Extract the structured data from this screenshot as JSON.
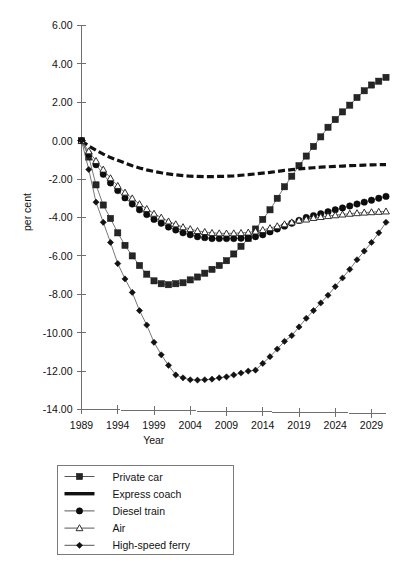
{
  "figure": {
    "width": 404,
    "height": 564,
    "background": "#ffffff"
  },
  "chart_data": {
    "type": "line",
    "title": "",
    "xlabel": "Year",
    "ylabel": "per cent",
    "grid": false,
    "legend_position": "below-left",
    "xlim": [
      1989,
      2031
    ],
    "ylim": [
      -14,
      6
    ],
    "ytick_step": 2,
    "x_tick_labels": [
      "1989",
      "1994",
      "1999",
      "2004",
      "2009",
      "2014",
      "2019",
      "2024",
      "2029"
    ],
    "x_tick_values": [
      1989,
      1994,
      1999,
      2004,
      2009,
      2014,
      2019,
      2024,
      2029
    ],
    "y_tick_labels": [
      "6.00",
      "4.00",
      "2.00",
      "0.00",
      "-2.00",
      "-4.00",
      "-6.00",
      "-8.00",
      "-10.00",
      "-12.00",
      "-14.00"
    ],
    "y_tick_values": [
      6,
      4,
      2,
      0,
      -2,
      -4,
      -6,
      -8,
      -10,
      -12,
      -14
    ],
    "x": [
      1989,
      1990,
      1991,
      1992,
      1993,
      1994,
      1995,
      1996,
      1997,
      1998,
      1999,
      2000,
      2001,
      2002,
      2003,
      2004,
      2005,
      2006,
      2007,
      2008,
      2009,
      2010,
      2011,
      2012,
      2013,
      2014,
      2015,
      2016,
      2017,
      2018,
      2019,
      2020,
      2021,
      2022,
      2023,
      2024,
      2025,
      2026,
      2027,
      2028,
      2029,
      2030,
      2031
    ],
    "series": [
      {
        "name": "Private car",
        "marker": "square",
        "color": "#262626",
        "values": [
          0.0,
          -0.85,
          -2.3,
          -3.35,
          -4.05,
          -4.8,
          -5.45,
          -6.0,
          -6.5,
          -6.95,
          -7.3,
          -7.45,
          -7.5,
          -7.45,
          -7.4,
          -7.25,
          -7.1,
          -6.9,
          -6.7,
          -6.5,
          -6.25,
          -5.9,
          -5.5,
          -5.1,
          -4.6,
          -4.1,
          -3.6,
          -3.0,
          -2.4,
          -1.85,
          -1.3,
          -0.8,
          -0.3,
          0.2,
          0.7,
          1.1,
          1.5,
          1.85,
          2.25,
          2.6,
          2.9,
          3.1,
          3.3
        ]
      },
      {
        "name": "Express coach",
        "marker": "thick-dash",
        "color": "#111111",
        "values": [
          0.0,
          -0.28,
          -0.5,
          -0.7,
          -0.88,
          -1.02,
          -1.16,
          -1.3,
          -1.42,
          -1.52,
          -1.6,
          -1.67,
          -1.73,
          -1.78,
          -1.82,
          -1.85,
          -1.86,
          -1.87,
          -1.87,
          -1.86,
          -1.85,
          -1.83,
          -1.8,
          -1.77,
          -1.73,
          -1.69,
          -1.65,
          -1.6,
          -1.55,
          -1.51,
          -1.47,
          -1.44,
          -1.41,
          -1.38,
          -1.36,
          -1.34,
          -1.32,
          -1.3,
          -1.29,
          -1.27,
          -1.26,
          -1.25,
          -1.25
        ]
      },
      {
        "name": "Diesel train",
        "marker": "circle",
        "color": "#0d0d0d",
        "values": [
          0.0,
          -0.7,
          -1.25,
          -1.75,
          -2.2,
          -2.6,
          -2.98,
          -3.3,
          -3.6,
          -3.85,
          -4.1,
          -4.3,
          -4.5,
          -4.65,
          -4.8,
          -4.9,
          -5.0,
          -5.05,
          -5.1,
          -5.1,
          -5.1,
          -5.1,
          -5.08,
          -5.05,
          -5.0,
          -4.9,
          -4.75,
          -4.6,
          -4.45,
          -4.3,
          -4.15,
          -4.0,
          -3.9,
          -3.8,
          -3.7,
          -3.6,
          -3.5,
          -3.4,
          -3.3,
          -3.2,
          -3.1,
          -3.0,
          -2.9
        ]
      },
      {
        "name": "Air",
        "marker": "triangle",
        "color": "#1a1a1a",
        "values": [
          0.0,
          -0.55,
          -1.05,
          -1.5,
          -1.95,
          -2.35,
          -2.7,
          -3.0,
          -3.3,
          -3.55,
          -3.8,
          -4.0,
          -4.2,
          -4.35,
          -4.5,
          -4.6,
          -4.7,
          -4.75,
          -4.8,
          -4.82,
          -4.83,
          -4.82,
          -4.8,
          -4.78,
          -4.72,
          -4.65,
          -4.55,
          -4.45,
          -4.35,
          -4.25,
          -4.15,
          -4.1,
          -4.02,
          -3.97,
          -3.92,
          -3.88,
          -3.84,
          -3.8,
          -3.77,
          -3.74,
          -3.72,
          -3.7,
          -3.68
        ]
      },
      {
        "name": "High-speed ferry",
        "marker": "diamond",
        "color": "#121212",
        "values": [
          0.0,
          -1.5,
          -3.2,
          -4.25,
          -5.3,
          -6.4,
          -7.2,
          -7.9,
          -8.85,
          -9.6,
          -10.5,
          -11.15,
          -11.7,
          -12.2,
          -12.35,
          -12.45,
          -12.47,
          -12.45,
          -12.42,
          -12.35,
          -12.3,
          -12.2,
          -12.1,
          -12.0,
          -11.95,
          -11.6,
          -11.25,
          -10.85,
          -10.45,
          -10.15,
          -9.7,
          -9.25,
          -8.85,
          -8.45,
          -8.05,
          -7.6,
          -7.15,
          -6.7,
          -6.2,
          -5.75,
          -5.3,
          -4.8,
          -4.25
        ]
      }
    ]
  },
  "legend": {
    "items": [
      {
        "label": "Private car",
        "marker": "square"
      },
      {
        "label": "Express coach",
        "marker": "thick-dash"
      },
      {
        "label": "Diesel train",
        "marker": "circle"
      },
      {
        "label": "Air",
        "marker": "triangle"
      },
      {
        "label": "High-speed ferry",
        "marker": "diamond"
      }
    ]
  }
}
